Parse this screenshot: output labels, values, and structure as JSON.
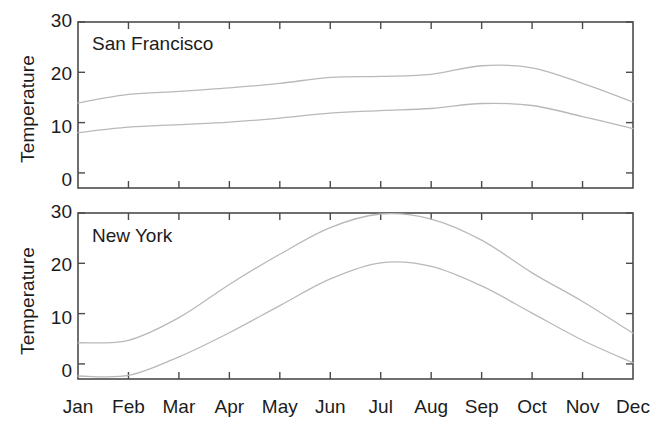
{
  "figure": {
    "width": 656,
    "height": 435,
    "background": "#ffffff",
    "axis_color": "#4b4b4b",
    "line_color": "#b9b9b9",
    "text_color": "#1c1c1c"
  },
  "axis": {
    "ylabel": "Temperature",
    "yticks": [
      "0",
      "10",
      "20",
      "30"
    ],
    "xticks": [
      "Jan",
      "Feb",
      "Mar",
      "Apr",
      "May",
      "Jun",
      "Jul",
      "Aug",
      "Sep",
      "Oct",
      "Nov",
      "Dec"
    ]
  },
  "panels": [
    {
      "title": "San Francisco"
    },
    {
      "title": "New York"
    }
  ],
  "chart_data": [
    {
      "type": "line",
      "title": "San Francisco",
      "xlabel": "",
      "ylabel": "Temperature",
      "categories": [
        "Jan",
        "Feb",
        "Mar",
        "Apr",
        "May",
        "Jun",
        "Jul",
        "Aug",
        "Sep",
        "Oct",
        "Nov",
        "Dec"
      ],
      "ylim": [
        -3,
        30
      ],
      "xlim": [
        "Jan",
        "Dec"
      ],
      "grid": false,
      "legend": "none",
      "series": [
        {
          "name": "high",
          "values": [
            13.9,
            15.6,
            16.2,
            16.9,
            17.8,
            19.0,
            19.2,
            19.6,
            21.3,
            20.9,
            17.8,
            14.1
          ]
        },
        {
          "name": "low",
          "values": [
            8.0,
            9.1,
            9.6,
            10.1,
            10.9,
            11.9,
            12.4,
            12.8,
            13.8,
            13.4,
            11.2,
            8.8
          ]
        }
      ]
    },
    {
      "type": "line",
      "title": "New York",
      "xlabel": "",
      "ylabel": "Temperature",
      "categories": [
        "Jan",
        "Feb",
        "Mar",
        "Apr",
        "May",
        "Jun",
        "Jul",
        "Aug",
        "Sep",
        "Oct",
        "Nov",
        "Dec"
      ],
      "ylim": [
        -3,
        30
      ],
      "xlim": [
        "Jan",
        "Dec"
      ],
      "grid": false,
      "legend": "none",
      "series": [
        {
          "name": "high",
          "values": [
            4.2,
            4.7,
            9.2,
            15.8,
            21.8,
            27.1,
            29.8,
            28.8,
            24.6,
            18.1,
            12.4,
            6.1
          ]
        },
        {
          "name": "low",
          "values": [
            -2.4,
            -2.3,
            1.4,
            6.2,
            11.6,
            16.9,
            20.1,
            19.4,
            15.5,
            10.1,
            4.7,
            0.2
          ]
        }
      ]
    }
  ]
}
